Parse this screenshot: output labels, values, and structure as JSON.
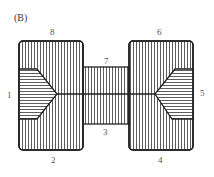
{
  "figure": {
    "panel_label": "(B)",
    "regions": [
      {
        "id": "1",
        "label": "1"
      },
      {
        "id": "2",
        "label": "2"
      },
      {
        "id": "3",
        "label": "3"
      },
      {
        "id": "4",
        "label": "4"
      },
      {
        "id": "5",
        "label": "5"
      },
      {
        "id": "6",
        "label": "6"
      },
      {
        "id": "7",
        "label": "7"
      },
      {
        "id": "8",
        "label": "8"
      }
    ],
    "colors": {
      "stroke": "#222222",
      "hatch": "#333333",
      "background": "#ffffff"
    }
  }
}
